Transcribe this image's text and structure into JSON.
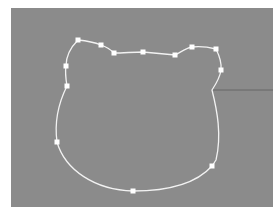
{
  "canvas": {
    "background": "#8b8b8b",
    "x": 11,
    "y": 8,
    "width": 262,
    "height": 199
  },
  "path": {
    "stroke": "#f2f2f2",
    "stroke_width": 1.3,
    "closed": true,
    "d": "M78,40 C88,41 96,43 101,45 C107,47 111,50 114,53 C124,53 133,52 143,52 C154,53 165,54 175,55 C181,52 186,48 192,47 C200,46 208,47 216,49 C219,55 222,62 221,70 C220,78 216,84 212,90 C217,110 222,135 216,160 C214,163 213,165 212,166 C195,185 165,191 133,191 C95,190 65,170 57,142 C54,120 60,100 67,86 C66,80 65,72 66,66 C66,58 70,48 78,40 Z"
  },
  "control_points": [
    {
      "x": 78,
      "y": 40
    },
    {
      "x": 101,
      "y": 45
    },
    {
      "x": 114,
      "y": 53
    },
    {
      "x": 143,
      "y": 52
    },
    {
      "x": 175,
      "y": 55
    },
    {
      "x": 192,
      "y": 47
    },
    {
      "x": 216,
      "y": 49
    },
    {
      "x": 221,
      "y": 70
    },
    {
      "x": 212,
      "y": 166
    },
    {
      "x": 133,
      "y": 191
    },
    {
      "x": 57,
      "y": 142
    },
    {
      "x": 67,
      "y": 86
    },
    {
      "x": 66,
      "y": 66
    }
  ],
  "guide_line": {
    "x1": 212,
    "y1": 90,
    "x2": 273,
    "y2": 90,
    "stroke": "#5e5e5e"
  },
  "handle_color": "#ffffff"
}
